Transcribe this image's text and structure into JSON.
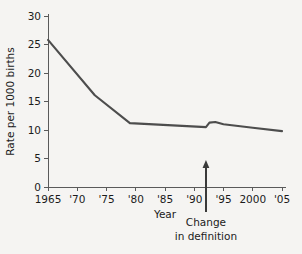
{
  "chart_data": {
    "type": "line",
    "title": "",
    "xlabel": "Year",
    "ylabel": "Rate per 1000 births",
    "xlim": [
      1965,
      2005
    ],
    "ylim": [
      0,
      30
    ],
    "grid": false,
    "legend": "none",
    "background_color": "#f5f4f2",
    "line_color": "#4d4d4d",
    "axis_color": "#5a5a5a",
    "text_color": "#1b1b1b",
    "y_ticks": [
      0,
      5,
      10,
      15,
      20,
      25,
      30
    ],
    "y_tick_labels": [
      "0",
      "5",
      "10",
      "15",
      "20",
      "25",
      "30"
    ],
    "x_ticks": [
      1965,
      1970,
      1975,
      1980,
      1985,
      1990,
      1995,
      2000,
      2005
    ],
    "x_tick_labels": [
      "1965",
      "'70",
      "'75",
      "'80",
      "'85",
      "'90",
      "'95",
      "2000",
      "'05"
    ],
    "series": [
      {
        "name": "Rate per 1000 births",
        "x": [
          1965,
          1973,
          1979,
          1992,
          1992.6,
          1993.6,
          1995,
          2000,
          2005
        ],
        "values": [
          25.8,
          16.1,
          11.2,
          10.5,
          11.3,
          11.4,
          11.0,
          10.4,
          9.8
        ]
      }
    ],
    "annotations": [
      {
        "name": "change-in-definition",
        "x": 1992,
        "line1": "Change",
        "line2": "in definition",
        "arrow": "up"
      }
    ]
  },
  "labels": {
    "y_axis_title": "Rate per 1000 births",
    "x_axis_title": "Year",
    "annotation_line1": "Change",
    "annotation_line2": "in definition"
  }
}
